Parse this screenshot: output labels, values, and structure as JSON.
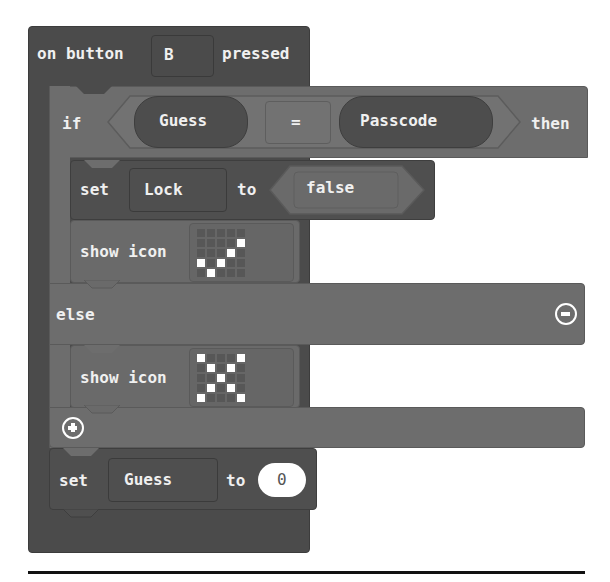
{
  "event_block": {
    "prefix": "on button",
    "button_value": "B",
    "suffix": "pressed"
  },
  "if_block": {
    "if_label": "if",
    "then_label": "then",
    "else_label": "else",
    "condition": {
      "left": "Guess",
      "operator": "=",
      "right": "Passcode"
    },
    "then_branch": {
      "set_block": {
        "set_label": "set",
        "variable": "Lock",
        "to_label": "to",
        "value": "false"
      },
      "show_icon": {
        "label": "show icon",
        "icon_name": "yes-checkmark",
        "leds": [
          [
            0,
            0,
            0,
            0,
            0
          ],
          [
            0,
            0,
            0,
            0,
            1
          ],
          [
            0,
            0,
            0,
            1,
            0
          ],
          [
            1,
            0,
            1,
            0,
            0
          ],
          [
            0,
            1,
            0,
            0,
            0
          ]
        ]
      }
    },
    "else_branch": {
      "show_icon": {
        "label": "show icon",
        "icon_name": "no-cross",
        "leds": [
          [
            1,
            0,
            0,
            0,
            1
          ],
          [
            0,
            1,
            0,
            1,
            0
          ],
          [
            0,
            0,
            1,
            0,
            0
          ],
          [
            0,
            1,
            0,
            1,
            0
          ],
          [
            1,
            0,
            0,
            0,
            1
          ]
        ]
      }
    },
    "remove_else_icon": "minus-circle-icon",
    "add_else_icon": "plus-circle-icon"
  },
  "set_guess_block": {
    "set_label": "set",
    "variable": "Guess",
    "to_label": "to",
    "value": "0"
  },
  "colors": {
    "event_block": "#4b4b4b",
    "if_block": "#6d6d6d",
    "variable_block": "#4f4f4f",
    "show_icon_block": "#6a6a6a",
    "background": "#ffffff"
  }
}
